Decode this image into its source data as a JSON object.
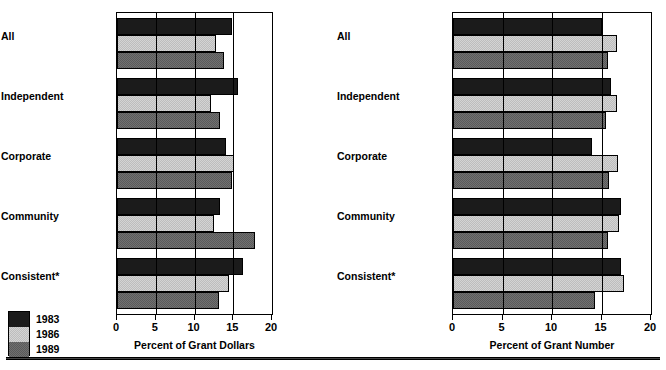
{
  "figure": {
    "legend": {
      "items": [
        {
          "label": "1983",
          "series": "1983",
          "color": "#1b1b1b"
        },
        {
          "label": "1986",
          "series": "1986",
          "color": "#d4d4d4"
        },
        {
          "label": "1989",
          "series": "1989",
          "color": "#707070"
        }
      ]
    }
  },
  "chart_data": [
    {
      "type": "bar",
      "orientation": "horizontal",
      "panel": "left",
      "title": "",
      "xlabel": "Percent of Grant Dollars",
      "ylabel": "",
      "xlim": [
        0,
        20
      ],
      "xticks": [
        0,
        5,
        10,
        15,
        20
      ],
      "xticklabels": [
        "0",
        "5",
        "10",
        "15",
        "20"
      ],
      "grid": true,
      "gridlines": [
        5,
        10,
        15
      ],
      "legend_position": "lower-left-outside",
      "categories": [
        "All",
        "Independent",
        "Corporate",
        "Community",
        "Consistent*"
      ],
      "series": [
        {
          "name": "1983",
          "values": [
            14.9,
            15.6,
            14.1,
            13.3,
            16.3
          ]
        },
        {
          "name": "1986",
          "values": [
            12.8,
            12.1,
            15.1,
            12.5,
            14.4
          ]
        },
        {
          "name": "1989",
          "values": [
            13.8,
            13.3,
            14.9,
            17.8,
            13.2
          ]
        }
      ]
    },
    {
      "type": "bar",
      "orientation": "horizontal",
      "panel": "right",
      "title": "",
      "xlabel": "Percent of Grant Number",
      "ylabel": "",
      "xlim": [
        0,
        20
      ],
      "xticks": [
        0,
        5,
        10,
        15,
        20
      ],
      "xticklabels": [
        "0",
        "5",
        "10",
        "15",
        "20"
      ],
      "grid": true,
      "gridlines": [
        5,
        10,
        15
      ],
      "legend_position": "shared",
      "categories": [
        "All",
        "Independent",
        "Corporate",
        "Community",
        "Consistent*"
      ],
      "series": [
        {
          "name": "1983",
          "values": [
            15.0,
            16.0,
            14.0,
            17.0,
            17.0
          ]
        },
        {
          "name": "1986",
          "values": [
            16.6,
            16.6,
            16.7,
            16.8,
            17.3
          ]
        },
        {
          "name": "1989",
          "values": [
            15.7,
            15.5,
            15.8,
            15.7,
            14.3
          ]
        }
      ]
    }
  ]
}
